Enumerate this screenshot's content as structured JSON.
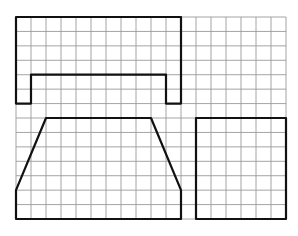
{
  "diagram": {
    "type": "grid-shapes",
    "grid": {
      "columns": 18,
      "rows": 14,
      "origin_x": 16,
      "origin_y": 17,
      "cell_w": 15,
      "cell_h": 14.43,
      "line_color": "#9a9a9a"
    },
    "stroke_color": "#111111",
    "shapes": [
      {
        "name": "notched-rectangle",
        "points_grid": [
          [
            0,
            0
          ],
          [
            11,
            0
          ],
          [
            11,
            6
          ],
          [
            10,
            6
          ],
          [
            10,
            4
          ],
          [
            1,
            4
          ],
          [
            1,
            6
          ],
          [
            0,
            6
          ]
        ]
      },
      {
        "name": "trapezoid-pentagon",
        "points_grid": [
          [
            2,
            7
          ],
          [
            9,
            7
          ],
          [
            11,
            12
          ],
          [
            11,
            14
          ],
          [
            0,
            14
          ],
          [
            0,
            12
          ]
        ]
      },
      {
        "name": "rectangle",
        "points_grid": [
          [
            12,
            7
          ],
          [
            18,
            7
          ],
          [
            18,
            14
          ],
          [
            12,
            14
          ]
        ]
      }
    ]
  }
}
